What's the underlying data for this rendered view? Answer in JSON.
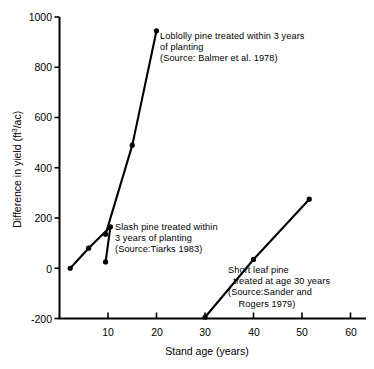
{
  "chart_data": {
    "type": "line",
    "title": "",
    "xlabel": "Stand age (years)",
    "ylabel_text": "Difference in yield (ft",
    "ylabel_sup": "3",
    "ylabel_tail": "/ac)",
    "ylabel": "Difference in yield (ft3/ac)",
    "xlim": [
      0,
      62
    ],
    "ylim": [
      -200,
      1000
    ],
    "xticks": [
      10,
      20,
      30,
      40,
      50,
      60
    ],
    "xtick_labels": [
      "10",
      "20",
      "30",
      "40",
      "50",
      "60"
    ],
    "yticks": [
      -200,
      0,
      200,
      400,
      600,
      800,
      1000
    ],
    "ytick_labels": [
      "-200",
      "0",
      "200",
      "400",
      "600",
      "800",
      "1000"
    ],
    "grid": false,
    "legend": "none (inline annotations)",
    "marker": "filled-circle",
    "line_color": "#000000",
    "series": [
      {
        "name": "Loblolly pine treated within 3 years of planting",
        "source": "Balmer et al. 1978",
        "x": [
          9.5,
          15,
          20
        ],
        "y": [
          135,
          490,
          945
        ]
      },
      {
        "name": "Slash pine treated within 3 years of planting",
        "source": "Tiarks 1983",
        "x": [
          2.2,
          6,
          10.5,
          9.5
        ],
        "y": [
          0,
          80,
          165,
          25
        ]
      },
      {
        "name": "Short leaf pine treated at age 30 years",
        "source": "Sander and Rogers 1979",
        "x": [
          30,
          40,
          51.5
        ],
        "y": [
          -195,
          35,
          275
        ]
      }
    ]
  },
  "annotations": {
    "loblolly": "Loblolly pine treated within 3 years\nof planting\n(Source: Balmer et al. 1978)",
    "slash": "Slash pine treated within\n3 years of planting\n(Source:Tiarks 1983)",
    "shortleaf": "Short leaf pine\n  treated at age 30 years\n(Source:Sander and\n    Rogers 1979)"
  }
}
